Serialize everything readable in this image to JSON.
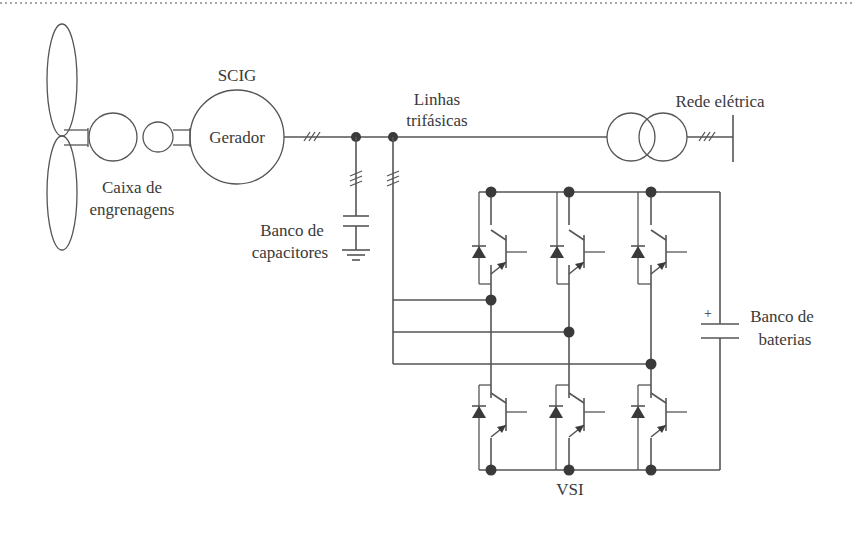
{
  "diagram": {
    "labels": {
      "generator_type": "SCIG",
      "generator": "Gerador",
      "gearbox_line1": "Caixa de",
      "gearbox_line2": "engrenagens",
      "lines_line1": "Linhas",
      "lines_line2": "trifásicas",
      "grid": "Rede elétrica",
      "capacitor_line1": "Banco de",
      "capacitor_line2": "capacitores",
      "battery_line1": "Banco de",
      "battery_line2": "baterias",
      "battery_polarity": "+",
      "inverter": "VSI"
    },
    "components": [
      {
        "id": "turbine",
        "type": "wind-turbine-blades"
      },
      {
        "id": "gearbox",
        "type": "gearbox"
      },
      {
        "id": "generator",
        "type": "squirrel-cage-induction-generator"
      },
      {
        "id": "three-phase-line",
        "type": "three-phase-line"
      },
      {
        "id": "capacitor-bank",
        "type": "capacitor-bank"
      },
      {
        "id": "transformer",
        "type": "transformer"
      },
      {
        "id": "grid",
        "type": "grid-bus"
      },
      {
        "id": "vsi",
        "type": "voltage-source-inverter",
        "legs": 3,
        "switches": 6
      },
      {
        "id": "battery-bank",
        "type": "battery-bank"
      }
    ],
    "colors": {
      "line": "#555555",
      "text": "#3a3a3a",
      "background": "#ffffff"
    }
  }
}
